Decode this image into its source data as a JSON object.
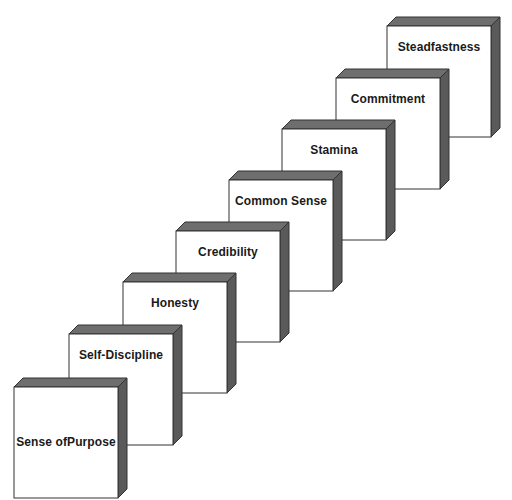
{
  "diagram": {
    "type": "staircase",
    "steps": [
      {
        "label": "Sense of Purpose",
        "line1": "Sense of",
        "line2": "Purpose",
        "x": 14,
        "y": 378
      },
      {
        "label": "Self-Discipline",
        "x": 69,
        "y": 325
      },
      {
        "label": "Honesty",
        "x": 123,
        "y": 273
      },
      {
        "label": "Credibility",
        "x": 176,
        "y": 222
      },
      {
        "label": "Common Sense",
        "x": 229,
        "y": 171
      },
      {
        "label": "Stamina",
        "x": 282,
        "y": 120
      },
      {
        "label": "Commitment",
        "x": 336,
        "y": 69
      },
      {
        "label": "Steadfastness",
        "x": 387,
        "y": 17
      }
    ],
    "colors": {
      "face": "#ffffff",
      "top": "#6e6e6e",
      "side": "#5a5a5a",
      "stroke": "#333333"
    }
  }
}
